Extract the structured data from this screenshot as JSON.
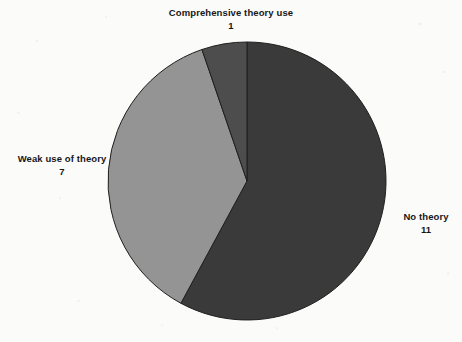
{
  "chart_data": {
    "type": "pie",
    "title": "",
    "categories": [
      "No theory",
      "Weak use of theory",
      "Comprehensive theory use"
    ],
    "values": [
      11,
      7,
      1
    ],
    "total": 19,
    "legend_position": "none",
    "labels_inline": true,
    "slices": [
      {
        "name": "No theory",
        "label": "No theory",
        "value": 11,
        "value_text": "11",
        "percent": 57.9,
        "start_angle_deg": 0,
        "end_angle_deg": 208.4,
        "color": "#3a3a3a"
      },
      {
        "name": "Weak use of theory",
        "label": "Weak use of theory",
        "value": 7,
        "value_text": "7",
        "percent": 36.8,
        "start_angle_deg": 208.4,
        "end_angle_deg": 341.1,
        "color": "#949494"
      },
      {
        "name": "Comprehensive theory use",
        "label": "Comprehensive theory use",
        "value": 1,
        "value_text": "1",
        "percent": 5.3,
        "start_angle_deg": 341.1,
        "end_angle_deg": 360,
        "color": "#4d4d4d"
      }
    ],
    "geometry": {
      "center_x": 247,
      "center_y": 181,
      "radius": 139
    },
    "colors": {
      "background": "#fbfbf9",
      "slice_border": "#1f1f1f",
      "text": "#16171b"
    }
  }
}
